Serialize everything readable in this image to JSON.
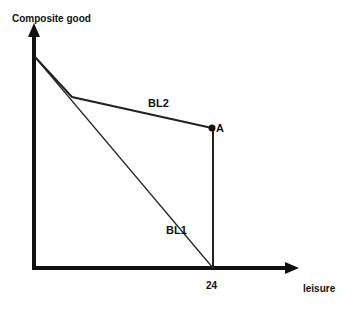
{
  "diagram": {
    "y_axis_label": "Composite good",
    "x_axis_label": "leisure",
    "x_tick_label": "24",
    "lines": [
      {
        "name": "BL1",
        "label": "BL1"
      },
      {
        "name": "BL2",
        "label": "BL2"
      }
    ],
    "point_label": "A"
  }
}
